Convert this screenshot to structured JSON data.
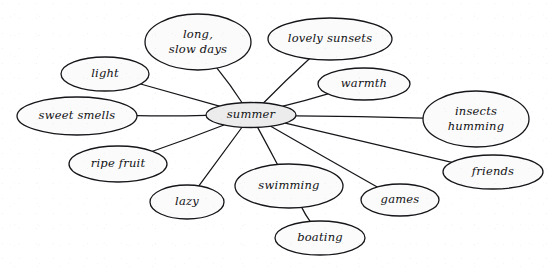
{
  "diagram": {
    "type": "concept-web",
    "title": "summer",
    "background_color": "#ffffff",
    "line_color": "#16161a",
    "central_fill": "#ececec",
    "satellite_fill": "#fbfbfb",
    "style": "hand-drawn cursive",
    "central_node": {
      "id": "summer",
      "label": "summer",
      "lines": [
        "summer"
      ],
      "cx": 251,
      "cy": 115,
      "rx": 45,
      "ry": 12.5
    },
    "nodes": [
      {
        "id": "long-slow-days",
        "label": "long, slow days",
        "lines": [
          "long,",
          "slow days"
        ],
        "cx": 198,
        "cy": 42,
        "rx": 53,
        "ry": 28,
        "parent": "summer"
      },
      {
        "id": "lovely-sunsets",
        "label": "lovely sunsets",
        "lines": [
          "lovely sunsets"
        ],
        "cx": 330,
        "cy": 39,
        "rx": 62,
        "ry": 21,
        "parent": "summer"
      },
      {
        "id": "light",
        "label": "light",
        "lines": [
          "light"
        ],
        "cx": 105,
        "cy": 74,
        "rx": 44,
        "ry": 17,
        "parent": "summer"
      },
      {
        "id": "sweet-smells",
        "label": "sweet smells",
        "lines": [
          "sweet smells"
        ],
        "cx": 77,
        "cy": 116,
        "rx": 60,
        "ry": 19,
        "parent": "summer"
      },
      {
        "id": "warmth",
        "label": "warmth",
        "lines": [
          "warmth"
        ],
        "cx": 364,
        "cy": 84,
        "rx": 46,
        "ry": 16,
        "parent": "summer"
      },
      {
        "id": "insects-humming",
        "label": "insects humming",
        "lines": [
          "insects",
          "humming"
        ],
        "cx": 476,
        "cy": 119,
        "rx": 53,
        "ry": 28,
        "parent": "summer"
      },
      {
        "id": "ripe-fruit",
        "label": "ripe fruit",
        "lines": [
          "ripe fruit"
        ],
        "cx": 118,
        "cy": 164,
        "rx": 49,
        "ry": 18,
        "parent": "summer"
      },
      {
        "id": "lazy",
        "label": "lazy",
        "lines": [
          "lazy"
        ],
        "cx": 187,
        "cy": 202,
        "rx": 37,
        "ry": 17,
        "parent": "summer"
      },
      {
        "id": "swimming",
        "label": "swimming",
        "lines": [
          "swimming"
        ],
        "cx": 289,
        "cy": 186,
        "rx": 54,
        "ry": 22,
        "parent": "summer"
      },
      {
        "id": "boating",
        "label": "boating",
        "lines": [
          "boating"
        ],
        "cx": 320,
        "cy": 238,
        "rx": 45,
        "ry": 17,
        "parent": "swimming"
      },
      {
        "id": "games",
        "label": "games",
        "lines": [
          "games"
        ],
        "cx": 400,
        "cy": 200,
        "rx": 39,
        "ry": 16,
        "parent": "summer"
      },
      {
        "id": "friends",
        "label": "friends",
        "lines": [
          "friends"
        ],
        "cx": 493,
        "cy": 172,
        "rx": 50,
        "ry": 17,
        "parent": "summer"
      }
    ],
    "edges": [
      {
        "id": "edge-summer-long-slow-days",
        "from": "summer",
        "to": "long-slow-days"
      },
      {
        "id": "edge-summer-lovely-sunsets",
        "from": "summer",
        "to": "lovely-sunsets"
      },
      {
        "id": "edge-summer-light",
        "from": "summer",
        "to": "light"
      },
      {
        "id": "edge-summer-sweet-smells",
        "from": "summer",
        "to": "sweet-smells"
      },
      {
        "id": "edge-summer-warmth",
        "from": "summer",
        "to": "warmth"
      },
      {
        "id": "edge-summer-insects-humming",
        "from": "summer",
        "to": "insects-humming"
      },
      {
        "id": "edge-summer-ripe-fruit",
        "from": "summer",
        "to": "ripe-fruit"
      },
      {
        "id": "edge-summer-lazy",
        "from": "summer",
        "to": "lazy"
      },
      {
        "id": "edge-summer-swimming",
        "from": "summer",
        "to": "swimming"
      },
      {
        "id": "edge-summer-games",
        "from": "summer",
        "to": "games"
      },
      {
        "id": "edge-summer-friends",
        "from": "summer",
        "to": "friends"
      },
      {
        "id": "edge-swimming-boating",
        "from": "swimming",
        "to": "boating"
      }
    ]
  }
}
